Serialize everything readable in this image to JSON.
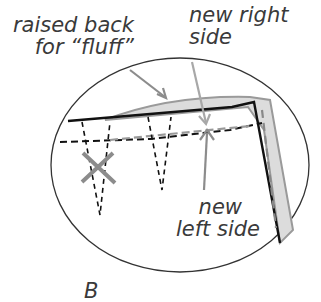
{
  "labels": {
    "raised_back_line1": "raised back",
    "raised_back_line2": "for “fluff”",
    "new_right_line1": "new right",
    "new_right_line2": "side",
    "new_left_line1": "new",
    "new_left_line2": "left side",
    "bottom_partial": "B"
  },
  "colors": {
    "outline": "#222222",
    "arrow": "#8c8c8c",
    "fill": "#d9d9d9"
  }
}
